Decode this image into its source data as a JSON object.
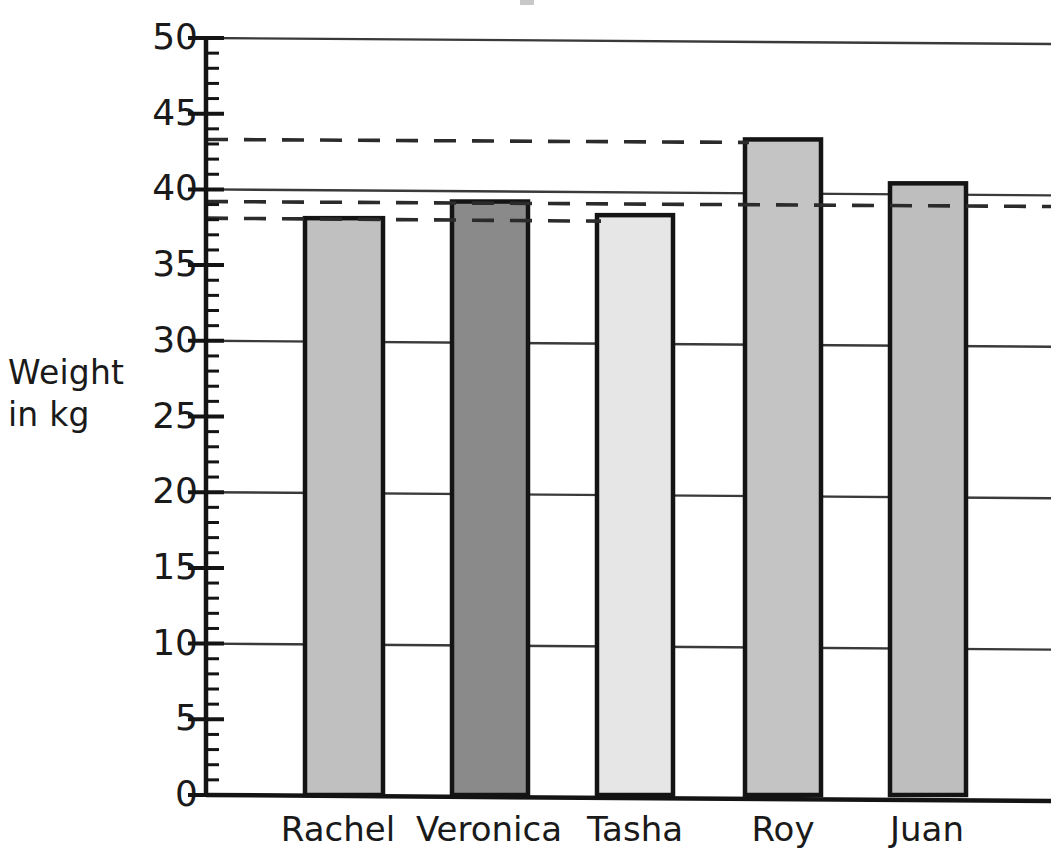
{
  "chart_data": {
    "type": "bar",
    "title": "",
    "xlabel": "",
    "ylabel": "Weight in kg",
    "ylabel_lines": [
      "Weight",
      "in kg"
    ],
    "categories": [
      "Rachel",
      "Veronica",
      "Tasha",
      "Roy",
      "Juan"
    ],
    "values": [
      38.1,
      39.2,
      38.3,
      43.3,
      40.4
    ],
    "series": [
      {
        "name": "Weight in kg",
        "values": [
          38.1,
          39.2,
          38.3,
          43.3,
          40.4
        ]
      }
    ],
    "ylim": [
      0,
      50
    ],
    "y_ticks": [
      0,
      5,
      10,
      15,
      20,
      25,
      30,
      35,
      40,
      45,
      50
    ],
    "y_tick_labels": [
      "0",
      "5",
      "10",
      "15",
      "20",
      "25",
      "30",
      "35",
      "40",
      "45",
      "50"
    ],
    "y_minor_tick_interval": 1,
    "grid": true,
    "gridlines": [
      10,
      20,
      30,
      40,
      50
    ],
    "legend": "none",
    "legend_position": "none",
    "annotations": {
      "dashed_reference_lines": [
        {
          "value": 43.3,
          "label": "Roy level",
          "extent": "axis-to-roy-bar"
        },
        {
          "value": 39.2,
          "label": "Veronica level",
          "extent": "axis-to-plot-right"
        },
        {
          "value": 38.1,
          "label": "Rachel and Tasha level",
          "extent": "axis-to-tasha-bar"
        }
      ]
    },
    "bar_colors": [
      "#c0c0c0",
      "#8a8a8a",
      "#e6e6e6",
      "#c4c4c4",
      "#bebebe"
    ],
    "bar_edge_color": "#141414",
    "axis_color": "#141414",
    "grid_color": "#3a3a3a",
    "background": "#ffffff"
  },
  "bars": [
    {
      "name": "Rachel",
      "value": 38.1,
      "color": "#c0c0c0"
    },
    {
      "name": "Veronica",
      "value": 39.2,
      "color": "#8a8a8a"
    },
    {
      "name": "Tasha",
      "value": 38.3,
      "color": "#e6e6e6"
    },
    {
      "name": "Roy",
      "value": 43.3,
      "color": "#c4c4c4"
    },
    {
      "name": "Juan",
      "value": 40.4,
      "color": "#bebebe"
    }
  ]
}
